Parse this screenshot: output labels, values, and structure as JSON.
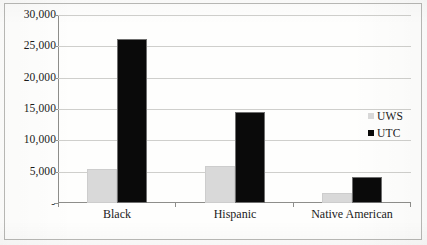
{
  "chart_data": {
    "type": "bar",
    "title": "",
    "subtitle": "",
    "xlabel": "",
    "ylabel": "",
    "categories": [
      "Black",
      "Hispanic",
      "Native American"
    ],
    "series": [
      {
        "name": "UWS",
        "color": "#d9d9d9",
        "values": [
          5400,
          5900,
          1600
        ]
      },
      {
        "name": "UTC",
        "color": "#0a0a0a",
        "values": [
          26100,
          14600,
          4100
        ]
      }
    ],
    "ylim": [
      0,
      30000
    ],
    "y_ticks": [
      0,
      5000,
      10000,
      15000,
      20000,
      25000,
      30000
    ],
    "y_tick_labels": [
      "-",
      "5,000",
      "10,000",
      "15,000",
      "20,000",
      "25,000",
      "30,000"
    ],
    "grid": true,
    "legend_position": "right"
  },
  "axis": {
    "y_labels": [
      {
        "text": "30,000",
        "value": 30000
      },
      {
        "text": "25,000",
        "value": 25000
      },
      {
        "text": "20,000",
        "value": 20000
      },
      {
        "text": "15,000",
        "value": 15000
      },
      {
        "text": "10,000",
        "value": 10000
      },
      {
        "text": "5,000",
        "value": 5000
      },
      {
        "text": "-",
        "value": 0
      }
    ],
    "x_labels": [
      "Black",
      "Hispanic",
      "Native American"
    ]
  },
  "legend": {
    "entries": [
      {
        "label": "UWS",
        "swatch": "legend-swatch-uws"
      },
      {
        "label": "UTC",
        "swatch": "legend-swatch-utc"
      }
    ]
  }
}
